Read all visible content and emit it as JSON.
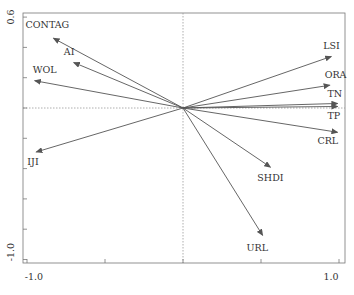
{
  "chart_data": {
    "type": "scatter",
    "subtype": "biplot-arrows",
    "title": "",
    "xlabel": "",
    "ylabel": "",
    "xlim": [
      -1.0,
      1.0
    ],
    "ylim": [
      -1.0,
      0.6
    ],
    "x_tick_labels": [
      "-1.0",
      "1.0"
    ],
    "y_tick_labels": [
      "0.6",
      "-1.0"
    ],
    "x_ticks": [
      -1.0,
      -0.5,
      0.0,
      0.5,
      1.0
    ],
    "y_ticks": [
      0.6,
      0.4,
      0.2,
      0.0,
      -0.2,
      -0.4,
      -0.6,
      -0.8,
      -1.0
    ],
    "grid": false,
    "reference_lines": {
      "x0": true,
      "y0": true,
      "style": "dotted"
    },
    "legend": null,
    "vectors": [
      {
        "name": "CONTAG",
        "x": -0.83,
        "y": 0.46,
        "label_dx": -28,
        "label_dy": -10
      },
      {
        "name": "AI",
        "x": -0.7,
        "y": 0.3,
        "label_dx": -10,
        "label_dy": -8
      },
      {
        "name": "WOL",
        "x": -0.95,
        "y": 0.18,
        "label_dx": -2,
        "label_dy": -8
      },
      {
        "name": "IJI",
        "x": -0.94,
        "y": -0.29,
        "label_dx": -9,
        "label_dy": 13
      },
      {
        "name": "LSI",
        "x": 0.95,
        "y": 0.34,
        "label_dx": -8,
        "label_dy": -7
      },
      {
        "name": "ORA",
        "x": 0.94,
        "y": 0.15,
        "label_dx": -5,
        "label_dy": -7
      },
      {
        "name": "TN",
        "x": 0.99,
        "y": 0.03,
        "label_dx": -10,
        "label_dy": -6
      },
      {
        "name": "TP",
        "x": 0.99,
        "y": 0.01,
        "label_dx": -10,
        "label_dy": 13
      },
      {
        "name": "CRL",
        "x": 0.99,
        "y": -0.16,
        "label_dx": -20,
        "label_dy": 12
      },
      {
        "name": "SHDI",
        "x": 0.56,
        "y": -0.39,
        "label_dx": -13,
        "label_dy": 14
      },
      {
        "name": "URL",
        "x": 0.51,
        "y": -0.84,
        "label_dx": -16,
        "label_dy": 16
      }
    ]
  },
  "axes": {
    "y_top_label": "0.6",
    "y_bottom_label": "-1.0",
    "x_left_label": "-1.0",
    "x_right_label": "1.0"
  },
  "colors": {
    "arrow": "#555555",
    "frame": "#777777",
    "reference": "#999999",
    "text": "#333333"
  }
}
